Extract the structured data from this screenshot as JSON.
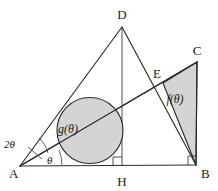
{
  "figure": {
    "type": "geometry-diagram",
    "background_color": "#ffffff",
    "stroke_color": "#2b2b2b",
    "shade_color": "#d2d2d2",
    "vertices": [
      {
        "name": "A",
        "label": "A",
        "x": 20,
        "y": 166
      },
      {
        "name": "B",
        "label": "B",
        "x": 196,
        "y": 165
      },
      {
        "name": "C",
        "label": "C",
        "x": 197,
        "y": 62
      },
      {
        "name": "D",
        "label": "D",
        "x": 122,
        "y": 27
      },
      {
        "name": "E",
        "label": "E",
        "x": 163,
        "y": 83
      },
      {
        "name": "H",
        "label": "H",
        "x": 122,
        "y": 166
      }
    ],
    "vertex_labels": [
      {
        "label": "A",
        "x": 9,
        "y": 178
      },
      {
        "label": "B",
        "x": 201,
        "y": 178
      },
      {
        "label": "C",
        "x": 197,
        "y": 55
      },
      {
        "label": "D",
        "x": 118,
        "y": 19
      },
      {
        "label": "E",
        "x": 157,
        "y": 77
      },
      {
        "label": "H",
        "x": 117,
        "y": 186
      }
    ],
    "region_labels": [
      {
        "name": "g-region-label",
        "label": "g(θ)",
        "x": 68,
        "y": 133
      },
      {
        "name": "f-region-label",
        "label": "f(θ)",
        "x": 168,
        "y": 101
      }
    ],
    "angle_labels": [
      {
        "name": "angle-two-theta",
        "label": "2θ",
        "x": 4,
        "y": 148
      },
      {
        "name": "angle-theta",
        "label": "θ",
        "x": 47,
        "y": 163
      }
    ],
    "circle": {
      "name": "inscribed-circle",
      "cx": 90,
      "cy": 130.5,
      "r": 33,
      "tangent_to": "AB"
    },
    "shaded_triangle": {
      "name": "f-region",
      "points": "163,83 197,62 196,165"
    },
    "segments": [
      {
        "name": "segment-AB",
        "from": "A",
        "to": "B"
      },
      {
        "name": "segment-AD",
        "from": "A",
        "to": "D"
      },
      {
        "name": "segment-DH",
        "from": "D",
        "to": "H"
      },
      {
        "name": "segment-DB",
        "from": "D",
        "to": "B"
      },
      {
        "name": "segment-AC",
        "from": "A",
        "to": "C"
      },
      {
        "name": "segment-CB",
        "from": "C",
        "to": "B"
      }
    ],
    "right_angle_marks": [
      {
        "name": "right-angle-at-H",
        "x": 122,
        "y": 166
      },
      {
        "name": "right-angle-at-B",
        "x": 196,
        "y": 165
      }
    ]
  }
}
